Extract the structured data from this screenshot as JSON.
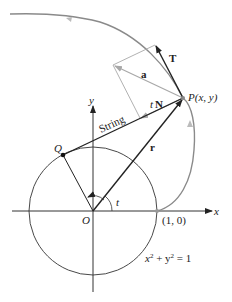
{
  "diagram": {
    "labels": {
      "T": "T",
      "a": "a",
      "tN_t": "t",
      "tN_N": "N",
      "P": "P(x, y)",
      "string": "String",
      "y_axis": "y",
      "x_axis": "x",
      "Q": "Q",
      "r": "r",
      "O": "O",
      "t_angle": "t",
      "point_1_0": "(1, 0)",
      "equation_x": "x",
      "equation_sup1": "2",
      "equation_plus": " + y",
      "equation_sup2": "2",
      "equation_eq": " = 1"
    },
    "colors": {
      "curve": "#8a8a8a",
      "vector_dark": "#222222",
      "vector_light": "#a8a8a8",
      "axis": "#333333"
    }
  }
}
